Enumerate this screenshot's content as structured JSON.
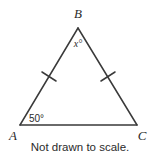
{
  "figure": {
    "type": "triangle-diagram",
    "stroke_color": "#3a3a3a",
    "text_color": "#2b2b2b",
    "background_color": "#ffffff",
    "vertices": [
      {
        "name": "A",
        "label": "A",
        "x": 20,
        "y": 125
      },
      {
        "name": "B",
        "label": "B",
        "x": 78,
        "y": 28
      },
      {
        "name": "C",
        "label": "C",
        "x": 137,
        "y": 125
      }
    ],
    "angles": [
      {
        "at": "B",
        "label": "x°"
      },
      {
        "at": "A",
        "label": "50°"
      }
    ],
    "tick_marks": [
      {
        "side": "AB",
        "count": 1
      },
      {
        "side": "BC",
        "count": 1
      }
    ]
  },
  "caption": {
    "text": "Not drawn to scale."
  }
}
